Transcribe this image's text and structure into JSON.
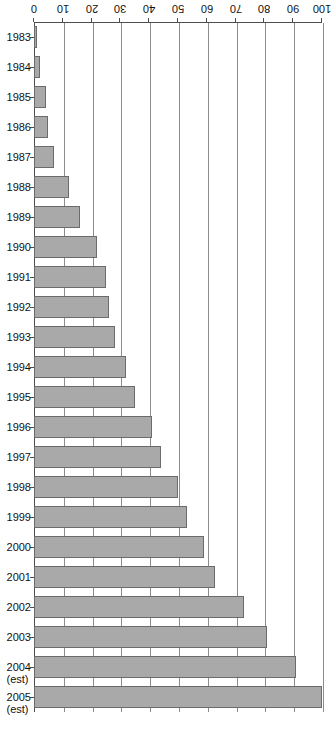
{
  "chart_data": {
    "type": "bar",
    "orientation": "horizontal",
    "title": "",
    "subtitle": "",
    "xlabel": "",
    "ylabel": "",
    "ylim": [
      0,
      100
    ],
    "grid": true,
    "legend": null,
    "tick_labels": [
      "100",
      "90",
      "80",
      "70",
      "60",
      "50",
      "40",
      "30",
      "20",
      "10",
      "0"
    ],
    "tick_values": [
      100,
      90,
      80,
      70,
      60,
      50,
      40,
      30,
      20,
      10,
      0
    ],
    "categories": [
      "1983",
      "1984",
      "1985",
      "1986",
      "1987",
      "1988",
      "1989",
      "1990",
      "1991",
      "1992",
      "1993",
      "1994",
      "1995",
      "1996",
      "1997",
      "1998",
      "1999",
      "2000",
      "2001",
      "2002",
      "2003",
      "2004",
      "2005"
    ],
    "category_notes": [
      "",
      "",
      "",
      "",
      "",
      "",
      "",
      "",
      "",
      "",
      "",
      "",
      "",
      "",
      "",
      "",
      "",
      "",
      "",
      "",
      "",
      "(est)",
      "(est)"
    ],
    "values": [
      1,
      2,
      4,
      5,
      7,
      12,
      16,
      22,
      25,
      26,
      28,
      32,
      35,
      41,
      44,
      50,
      53,
      59,
      63,
      73,
      81,
      91,
      100
    ],
    "series": [
      {
        "name": "",
        "values": [
          1,
          2,
          4,
          5,
          7,
          12,
          16,
          22,
          25,
          26,
          28,
          32,
          35,
          41,
          44,
          50,
          53,
          59,
          63,
          73,
          81,
          91,
          100
        ]
      }
    ]
  },
  "style": {
    "bar_fill": "#a9a9a9",
    "bar_stroke": "#6b6b6b",
    "grid_color": "#8c8c8c",
    "axis_color": "#4d4d4d",
    "text_color": "#111111",
    "background": "#ffffff"
  }
}
